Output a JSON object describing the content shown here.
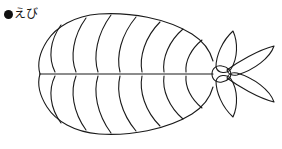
{
  "page": {
    "width": 282,
    "height": 149,
    "background_color": "#ffffff",
    "kind": "line-art-illustration"
  },
  "label": {
    "bullet": "●",
    "bullet_icon_name": "filled-circle-bullet-icon",
    "text": "えび",
    "romaji_meaning": "ebi (shrimp / prawn)",
    "color": "#111111",
    "font_size_px": 12
  },
  "illustration": {
    "name": "shrimp-line-drawing",
    "subject": "えび",
    "style": "black outline, no fill, white background",
    "stroke_color": "#1a1a1a",
    "stroke_width_px": 1.1,
    "fill": "none",
    "orientation": "head at left, tail fan at right",
    "body": {
      "left_tip_x": 38,
      "right_joint_x": 213,
      "top_y": 14,
      "bottom_y": 140,
      "midline_y": 74,
      "midline_from_x": 40,
      "midline_to_x": 213,
      "segment_divider_count": 7,
      "segment_divider_x": [
        55,
        76,
        98,
        120,
        142,
        164,
        186
      ],
      "symmetry": "upper half mirrored to lower half about the midline",
      "left_end_shape": "rounded bulge with a pinch/notch at the midline"
    },
    "tail": {
      "joint_name": "tail-joint-oval",
      "joint_center_x": 221,
      "joint_center_y": 74,
      "joint_rx": 9,
      "joint_ry": 7,
      "fin_count": 4,
      "fins": [
        {
          "name": "tail-fin-upper-outer",
          "direction": "up-right"
        },
        {
          "name": "tail-fin-upper-inner",
          "direction": "up-left"
        },
        {
          "name": "tail-fin-lower-outer",
          "direction": "down-right"
        },
        {
          "name": "tail-fin-lower-inner",
          "direction": "down-left"
        }
      ],
      "fin_shape": "elongated pointed leaf / lens"
    }
  }
}
